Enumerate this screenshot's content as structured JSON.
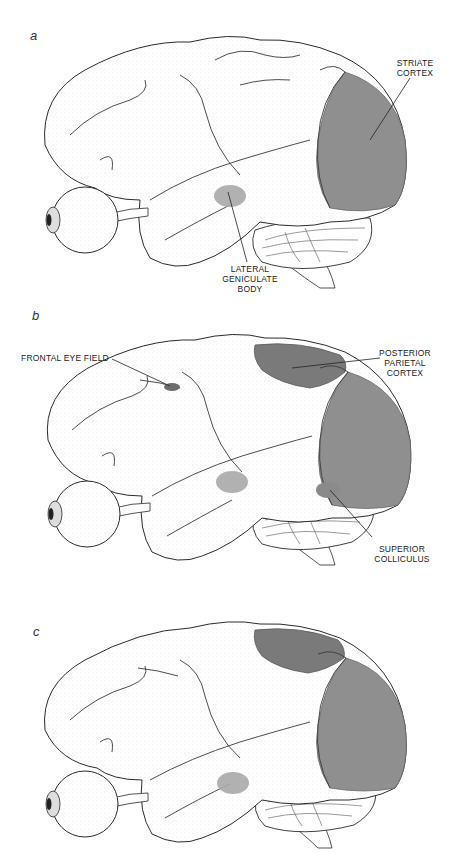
{
  "figure": {
    "panels": [
      {
        "letter": "a",
        "labels": {
          "striate_cortex": [
            "STRIATE",
            "CORTEX"
          ],
          "lateral_geniculate_body": [
            "LATERAL",
            "GENICULATE",
            "BODY"
          ]
        }
      },
      {
        "letter": "b",
        "labels": {
          "frontal_eye_field": "FRONTAL EYE FIELD",
          "posterior_parietal_cortex": [
            "POSTERIOR",
            "PARIETAL",
            "CORTEX"
          ],
          "superior_colliculus": [
            "SUPERIOR",
            "COLLICULUS"
          ]
        }
      },
      {
        "letter": "c",
        "labels": {}
      }
    ],
    "colors": {
      "background": "#ffffff",
      "outline": "#2a2a2a",
      "stipple": "#9a9a9a",
      "region_fill": "#8f8f8f",
      "region_fill_dark": "#7a7a7a",
      "small_region_fill": "#a8a8a8",
      "text": "#222222"
    }
  }
}
